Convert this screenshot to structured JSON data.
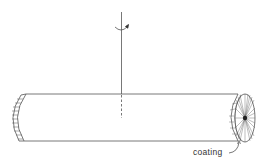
{
  "diagram": {
    "type": "coated cylinder rotating about vertical axis",
    "labels": {
      "coating": "coating"
    },
    "colors": {
      "line": "#555555",
      "background": "#ffffff"
    }
  }
}
